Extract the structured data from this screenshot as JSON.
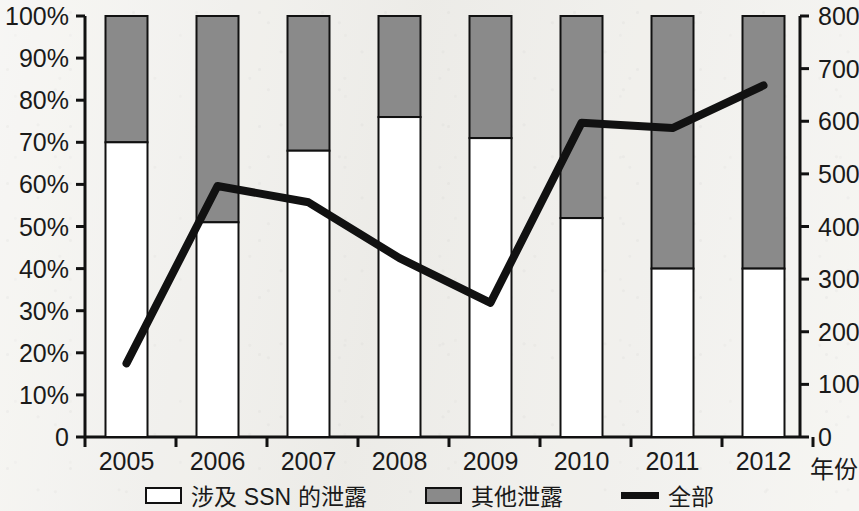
{
  "chart_data": {
    "type": "bar",
    "title": "",
    "subtitle": "",
    "xlabel": "年份",
    "ylabel": "",
    "categories": [
      "2005",
      "2006",
      "2007",
      "2008",
      "2009",
      "2010",
      "2011",
      "2012"
    ],
    "left_axis": {
      "label": "",
      "ticks": [
        "0",
        "10%",
        "20%",
        "30%",
        "40%",
        "50%",
        "60%",
        "70%",
        "80%",
        "90%",
        "100%"
      ],
      "tick_values": [
        0,
        10,
        20,
        30,
        40,
        50,
        60,
        70,
        80,
        90,
        100
      ],
      "ylim": [
        0,
        100
      ],
      "unit": "percent"
    },
    "right_axis": {
      "label": "",
      "ticks": [
        "0",
        "100",
        "200",
        "300",
        "400",
        "500",
        "600",
        "700",
        "800"
      ],
      "tick_values": [
        0,
        100,
        200,
        300,
        400,
        500,
        600,
        700,
        800
      ],
      "ylim": [
        0,
        800
      ],
      "unit": "count"
    },
    "grid": false,
    "legend_position": "bottom",
    "stacked": true,
    "series": [
      {
        "name": "涉及 SSN 的泄露",
        "type": "bar-segment",
        "axis": "left",
        "color": "#ffffff",
        "border": "#111111",
        "values": [
          70,
          51,
          68,
          76,
          71,
          52,
          40,
          40
        ]
      },
      {
        "name": "其他泄露",
        "type": "bar-segment",
        "axis": "left",
        "color": "#8a8a8a",
        "border": "#111111",
        "values": [
          30,
          49,
          32,
          24,
          29,
          48,
          60,
          60
        ]
      },
      {
        "name": "全部",
        "type": "line",
        "axis": "right",
        "color": "#111111",
        "values": [
          140,
          477,
          446,
          340,
          255,
          597,
          587,
          668
        ]
      }
    ]
  },
  "legend": {
    "items": [
      {
        "label": "涉及 SSN 的泄露",
        "marker": "white-box-swatch"
      },
      {
        "label": "其他泄露",
        "marker": "gray-box-swatch"
      },
      {
        "label": "全部",
        "marker": "black-line-swatch"
      }
    ]
  },
  "colors": {
    "background": "#f1f0ec",
    "ink": "#111111",
    "bar_other": "#8a8a8a",
    "bar_ssn": "#ffffff",
    "line_total": "#111111"
  }
}
